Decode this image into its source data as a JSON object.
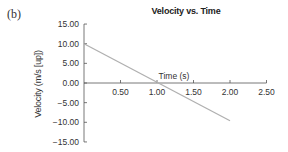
{
  "panel_label": "(b)",
  "chart_data": {
    "type": "line",
    "title": "Velocity vs. Time",
    "xlabel": "Time (s)",
    "ylabel": "Velocity (m/s [up])",
    "x_ticks": [
      "0.50",
      "1.00",
      "1.50",
      "2.00",
      "2.50"
    ],
    "y_ticks": [
      "15.00",
      "10.00",
      "5.00",
      "0.00",
      "−15.00"
    ],
    "y_tick_labels": [
      "15.00",
      "10.00",
      "5.00",
      "0.00",
      "−5.00",
      "−10.00",
      "−15.00"
    ],
    "xlim": [
      0,
      2.5
    ],
    "ylim": [
      -15,
      15
    ],
    "grid": false,
    "legend": null,
    "series": [
      {
        "name": "Velocity",
        "color": "#b0b0b0",
        "x": [
          0,
          2.0
        ],
        "y": [
          10.0,
          -9.6
        ]
      }
    ]
  }
}
